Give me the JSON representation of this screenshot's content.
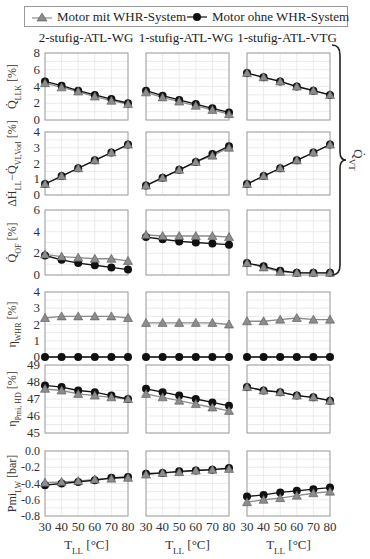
{
  "legend": {
    "series_with": "Motor mit WHR-System",
    "series_without": "Motor ohne WHR-System"
  },
  "columns": [
    "2-stufig-ATL-WG",
    "1-stufig-ATL-WG",
    "1-stufig-ATL-VTG"
  ],
  "brace_label": "Q̇ VT",
  "colors": {
    "with_whr": "#8c8c8c",
    "without_whr": "#111111",
    "grid": "#e6e6e6",
    "frame": "#a0a0a0"
  },
  "chart_data": {
    "type": "line",
    "title": "",
    "x": [
      30,
      40,
      50,
      60,
      70,
      80
    ],
    "xlabel": "T_LL [°C]",
    "xticks": [
      30,
      40,
      50,
      60,
      70,
      80
    ],
    "legend_position": "top",
    "grid": true,
    "rows": [
      {
        "ylabel": "Q̇_LLK [%]",
        "ylim": [
          0,
          8
        ],
        "yticks": [
          0,
          2,
          4,
          6,
          8
        ],
        "ytick_labels": [
          "0",
          "2",
          "4",
          "6",
          "8"
        ],
        "panels": [
          {
            "column": "2-stufig-ATL-WG",
            "series": [
              {
                "name": "Motor mit WHR-System",
                "values": [
                  4.4,
                  3.9,
                  3.4,
                  2.8,
                  2.3,
                  1.9
                ]
              },
              {
                "name": "Motor ohne WHR-System",
                "values": [
                  4.6,
                  4.1,
                  3.5,
                  3.0,
                  2.5,
                  2.0
                ]
              }
            ]
          },
          {
            "column": "1-stufig-ATL-WG",
            "series": [
              {
                "name": "Motor mit WHR-System",
                "values": [
                  3.3,
                  2.7,
                  2.2,
                  1.7,
                  1.2,
                  0.7
                ]
              },
              {
                "name": "Motor ohne WHR-System",
                "values": [
                  3.5,
                  2.9,
                  2.4,
                  1.9,
                  1.4,
                  0.9
                ]
              }
            ]
          },
          {
            "column": "1-stufig-ATL-VTG",
            "series": [
              {
                "name": "Motor mit WHR-System",
                "values": [
                  5.6,
                  5.1,
                  4.6,
                  4.0,
                  3.5,
                  3.0
                ]
              },
              {
                "name": "Motor ohne WHR-System",
                "values": [
                  5.6,
                  5.1,
                  4.6,
                  4.0,
                  3.5,
                  3.0
                ]
              }
            ]
          }
        ]
      },
      {
        "ylabel": "ΔḢ_LL−Q̇_VI,Vorl [%]",
        "ylim": [
          0,
          4
        ],
        "yticks": [
          0,
          1,
          2,
          3,
          4
        ],
        "ytick_labels": [
          "0",
          "1",
          "2",
          "3",
          "4"
        ],
        "panels": [
          {
            "column": "2-stufig-ATL-WG",
            "series": [
              {
                "name": "Motor mit WHR-System",
                "values": [
                  0.7,
                  1.2,
                  1.7,
                  2.2,
                  2.7,
                  3.2
                ]
              },
              {
                "name": "Motor ohne WHR-System",
                "values": [
                  0.7,
                  1.2,
                  1.7,
                  2.2,
                  2.7,
                  3.2
                ]
              }
            ]
          },
          {
            "column": "1-stufig-ATL-WG",
            "series": [
              {
                "name": "Motor mit WHR-System",
                "values": [
                  0.6,
                  1.1,
                  1.6,
                  2.1,
                  2.5,
                  3.0
                ]
              },
              {
                "name": "Motor ohne WHR-System",
                "values": [
                  0.6,
                  1.1,
                  1.6,
                  2.1,
                  2.6,
                  3.1
                ]
              }
            ]
          },
          {
            "column": "1-stufig-ATL-VTG",
            "series": [
              {
                "name": "Motor mit WHR-System",
                "values": [
                  0.7,
                  1.2,
                  1.7,
                  2.2,
                  2.7,
                  3.2
                ]
              },
              {
                "name": "Motor ohne WHR-System",
                "values": [
                  0.7,
                  1.2,
                  1.7,
                  2.2,
                  2.7,
                  3.2
                ]
              }
            ]
          }
        ]
      },
      {
        "ylabel": "Q̇_OF [%]",
        "ylim": [
          0,
          6
        ],
        "yticks": [
          0,
          2,
          4,
          6
        ],
        "ytick_labels": [
          "0",
          "2",
          "4",
          "6"
        ],
        "panels": [
          {
            "column": "2-stufig-ATL-WG",
            "series": [
              {
                "name": "Motor mit WHR-System",
                "values": [
                  1.9,
                  1.7,
                  1.6,
                  1.5,
                  1.5,
                  1.3
                ]
              },
              {
                "name": "Motor ohne WHR-System",
                "values": [
                  1.8,
                  1.4,
                  1.1,
                  0.9,
                  0.7,
                  0.5
                ]
              }
            ]
          },
          {
            "column": "1-stufig-ATL-WG",
            "series": [
              {
                "name": "Motor mit WHR-System",
                "values": [
                  3.7,
                  3.6,
                  3.6,
                  3.6,
                  3.6,
                  3.5
                ]
              },
              {
                "name": "Motor ohne WHR-System",
                "values": [
                  3.5,
                  3.3,
                  3.1,
                  3.0,
                  2.9,
                  2.8
                ]
              }
            ]
          },
          {
            "column": "1-stufig-ATL-VTG",
            "series": [
              {
                "name": "Motor mit WHR-System",
                "values": [
                  1.1,
                  0.7,
                  0.3,
                  0.2,
                  0.2,
                  0.2
                ]
              },
              {
                "name": "Motor ohne WHR-System",
                "values": [
                  1.1,
                  0.8,
                  0.4,
                  0.2,
                  0.2,
                  0.2
                ]
              }
            ]
          }
        ]
      },
      {
        "ylabel": "η_WHR [%]",
        "ylim": [
          0,
          4
        ],
        "yticks": [
          0,
          1,
          2,
          3,
          4
        ],
        "ytick_labels": [
          "0",
          "1",
          "2",
          "3",
          "4"
        ],
        "panels": [
          {
            "column": "2-stufig-ATL-WG",
            "series": [
              {
                "name": "Motor mit WHR-System",
                "values": [
                  2.4,
                  2.5,
                  2.5,
                  2.5,
                  2.5,
                  2.4
                ]
              },
              {
                "name": "Motor ohne WHR-System",
                "values": [
                  0,
                  0,
                  0,
                  0,
                  0,
                  0
                ]
              }
            ]
          },
          {
            "column": "1-stufig-ATL-WG",
            "series": [
              {
                "name": "Motor mit WHR-System",
                "values": [
                  2.1,
                  2.1,
                  2.1,
                  2.1,
                  2.1,
                  2.0
                ]
              },
              {
                "name": "Motor ohne WHR-System",
                "values": [
                  0,
                  0,
                  0,
                  0,
                  0,
                  0
                ]
              }
            ]
          },
          {
            "column": "1-stufig-ATL-VTG",
            "series": [
              {
                "name": "Motor mit WHR-System",
                "values": [
                  2.2,
                  2.2,
                  2.3,
                  2.4,
                  2.3,
                  2.3
                ]
              },
              {
                "name": "Motor ohne WHR-System",
                "values": [
                  0,
                  0,
                  0,
                  0,
                  0,
                  0
                ]
              }
            ]
          }
        ]
      },
      {
        "ylabel": "η_Pmi,HD [%]",
        "ylim": [
          45,
          49
        ],
        "yticks": [
          45,
          46,
          47,
          48,
          49
        ],
        "ytick_labels": [
          "45",
          "46",
          "47",
          "48",
          "49"
        ],
        "panels": [
          {
            "column": "2-stufig-ATL-WG",
            "series": [
              {
                "name": "Motor mit WHR-System",
                "values": [
                  47.6,
                  47.5,
                  47.3,
                  47.2,
                  47.1,
                  47.0
                ]
              },
              {
                "name": "Motor ohne WHR-System",
                "values": [
                  47.8,
                  47.7,
                  47.5,
                  47.4,
                  47.2,
                  47.0
                ]
              }
            ]
          },
          {
            "column": "1-stufig-ATL-WG",
            "series": [
              {
                "name": "Motor mit WHR-System",
                "values": [
                  47.3,
                  47.1,
                  46.9,
                  46.7,
                  46.5,
                  46.3
                ]
              },
              {
                "name": "Motor ohne WHR-System",
                "values": [
                  47.6,
                  47.4,
                  47.2,
                  47.0,
                  46.8,
                  46.6
                ]
              }
            ]
          },
          {
            "column": "1-stufig-ATL-VTG",
            "series": [
              {
                "name": "Motor mit WHR-System",
                "values": [
                  47.7,
                  47.5,
                  47.4,
                  47.2,
                  47.1,
                  46.9
                ]
              },
              {
                "name": "Motor ohne WHR-System",
                "values": [
                  47.7,
                  47.5,
                  47.4,
                  47.2,
                  47.1,
                  46.9
                ]
              }
            ]
          }
        ]
      },
      {
        "ylabel": "Pmi_LW [bar]",
        "ylim": [
          -0.8,
          0.0
        ],
        "yticks": [
          -0.8,
          -0.6,
          -0.4,
          -0.2,
          0.0
        ],
        "ytick_labels": [
          "-0.8",
          "-0.6",
          "-0.4",
          "-0.2",
          "0.0"
        ],
        "panels": [
          {
            "column": "2-stufig-ATL-WG",
            "series": [
              {
                "name": "Motor mit WHR-System",
                "values": [
                  -0.39,
                  -0.38,
                  -0.37,
                  -0.35,
                  -0.34,
                  -0.33
                ]
              },
              {
                "name": "Motor ohne WHR-System",
                "values": [
                  -0.42,
                  -0.4,
                  -0.38,
                  -0.36,
                  -0.33,
                  -0.32
                ]
              }
            ]
          },
          {
            "column": "1-stufig-ATL-WG",
            "series": [
              {
                "name": "Motor mit WHR-System",
                "values": [
                  -0.29,
                  -0.27,
                  -0.26,
                  -0.24,
                  -0.23,
                  -0.22
                ]
              },
              {
                "name": "Motor ohne WHR-System",
                "values": [
                  -0.28,
                  -0.27,
                  -0.25,
                  -0.24,
                  -0.23,
                  -0.21
                ]
              }
            ]
          },
          {
            "column": "1-stufig-ATL-VTG",
            "series": [
              {
                "name": "Motor mit WHR-System",
                "values": [
                  -0.63,
                  -0.6,
                  -0.58,
                  -0.55,
                  -0.52,
                  -0.5
                ]
              },
              {
                "name": "Motor ohne WHR-System",
                "values": [
                  -0.56,
                  -0.54,
                  -0.51,
                  -0.49,
                  -0.47,
                  -0.45
                ]
              }
            ]
          }
        ]
      }
    ]
  }
}
